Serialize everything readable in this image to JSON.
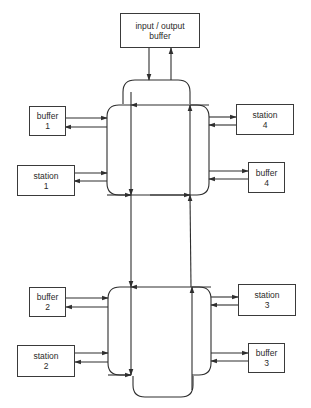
{
  "diagram": {
    "title": "",
    "nodes": {
      "io_buffer": {
        "line1": "input / output",
        "line2": "buffer"
      },
      "buffer_1": {
        "line1": "buffer",
        "line2": "1"
      },
      "station_1": {
        "line1": "station",
        "line2": "1"
      },
      "station_4": {
        "line1": "station",
        "line2": "4"
      },
      "buffer_4": {
        "line1": "buffer",
        "line2": "4"
      },
      "buffer_2": {
        "line1": "buffer",
        "line2": "2"
      },
      "station_2": {
        "line1": "station",
        "line2": "2"
      },
      "station_3": {
        "line1": "station",
        "line2": "3"
      },
      "buffer_3": {
        "line1": "buffer",
        "line2": "3"
      }
    },
    "colors": {
      "stroke": "#2e2e2e",
      "box_border": "#3a3a3a",
      "text": "#2a2a2a",
      "background": "#ffffff"
    },
    "connections": [
      {
        "from": "io_buffer",
        "to": "upper-loop",
        "direction": "down"
      },
      {
        "from": "upper-loop",
        "to": "io_buffer",
        "direction": "up"
      },
      {
        "from": "buffer_1",
        "to": "upper-hub",
        "direction": "right"
      },
      {
        "from": "upper-hub",
        "to": "buffer_1",
        "direction": "left"
      },
      {
        "from": "station_1",
        "to": "upper-hub",
        "direction": "right"
      },
      {
        "from": "upper-hub",
        "to": "station_1",
        "direction": "left"
      },
      {
        "from": "upper-hub",
        "to": "station_4",
        "direction": "right"
      },
      {
        "from": "station_4",
        "to": "upper-hub",
        "direction": "left"
      },
      {
        "from": "upper-hub",
        "to": "buffer_4",
        "direction": "right"
      },
      {
        "from": "buffer_4",
        "to": "upper-hub",
        "direction": "left"
      },
      {
        "from": "upper-loop",
        "to": "lower-loop",
        "direction": "down"
      },
      {
        "from": "lower-loop",
        "to": "upper-loop",
        "direction": "up"
      },
      {
        "from": "buffer_2",
        "to": "lower-hub",
        "direction": "right"
      },
      {
        "from": "lower-hub",
        "to": "buffer_2",
        "direction": "left"
      },
      {
        "from": "station_2",
        "to": "lower-hub",
        "direction": "right"
      },
      {
        "from": "lower-hub",
        "to": "station_2",
        "direction": "left"
      },
      {
        "from": "lower-hub",
        "to": "station_3",
        "direction": "right"
      },
      {
        "from": "station_3",
        "to": "lower-hub",
        "direction": "left"
      },
      {
        "from": "lower-hub",
        "to": "buffer_3",
        "direction": "right"
      },
      {
        "from": "buffer_3",
        "to": "lower-hub",
        "direction": "left"
      }
    ]
  }
}
